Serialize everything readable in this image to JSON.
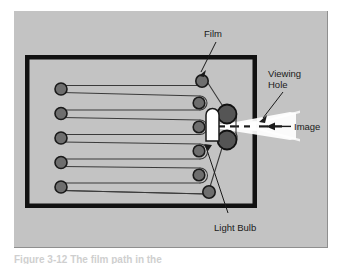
{
  "figure": {
    "type": "technical-diagram",
    "panel_background_color": "#c3c3c3",
    "page_background_color": "#ffffff",
    "frame_color": "#111111",
    "roller_fill_color": "#6e6e6e",
    "roller_stroke_color": "#1a1a1a",
    "large_roller_fill_color": "#555555",
    "film_line_color": "#3a3a3a",
    "light_color": "#ffffff",
    "bulb_color": "#ffffff"
  },
  "labels": {
    "film": "Film",
    "viewing_hole_line1": "Viewing",
    "viewing_hole_line2": "Hole",
    "image": "Image",
    "light_bulb": "Light Bulb"
  },
  "components": {
    "left_rollers_count": 5,
    "right_rollers_count": 5,
    "large_rollers_count": 2,
    "corner_rollers_count": 2,
    "film_passes": 6
  },
  "caption": {
    "partial_text": "Figure 3-12  The film path in the"
  }
}
